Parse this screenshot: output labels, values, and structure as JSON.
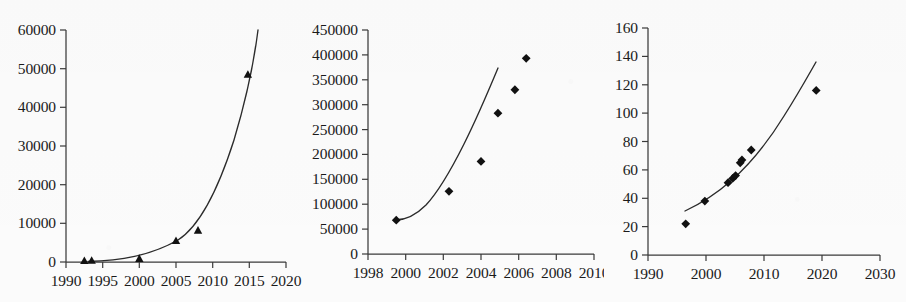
{
  "figure": {
    "panel_count": 3,
    "background_color": "#fbfbfb",
    "marker_color": "#111111",
    "curve_color": "#2b2b2b",
    "axis_color": "#3a3a3a"
  },
  "chart_data": [
    {
      "id": "panel-a",
      "type": "scatter",
      "title": "",
      "xlabel": "",
      "ylabel": "",
      "xlim": [
        1990,
        2020
      ],
      "ylim": [
        0,
        60000
      ],
      "xticks": [
        1990,
        1995,
        2000,
        2005,
        2010,
        2015,
        2020
      ],
      "xtick_labels": [
        "1990",
        "1995",
        "2000",
        "2005",
        "2010",
        "2015",
        "2020"
      ],
      "yticks": [
        0,
        10000,
        20000,
        30000,
        40000,
        50000,
        60000
      ],
      "ytick_labels": [
        "0",
        "10000",
        "20000",
        "30000",
        "40000",
        "50000",
        "60000"
      ],
      "grid": false,
      "legend": "none",
      "marker_shape": "triangle",
      "x": [
        1992.5,
        1993.5,
        2000.0,
        2005.0,
        2008.0,
        2014.8
      ],
      "y": [
        350,
        400,
        900,
        5500,
        8200,
        48500
      ],
      "fit_curve": {
        "type": "exponential",
        "x_start": 1993.0,
        "x_end": 2015.3,
        "y_start": 100,
        "y_end": 56000
      }
    },
    {
      "id": "panel-b",
      "type": "scatter",
      "title": "",
      "xlabel": "",
      "ylabel": "",
      "xlim": [
        1998,
        2010
      ],
      "ylim": [
        0,
        450000
      ],
      "xticks": [
        1998,
        2000,
        2002,
        2004,
        2006,
        2008,
        2010
      ],
      "xtick_labels": [
        "1998",
        "2000",
        "2002",
        "2004",
        "2006",
        "2008",
        "2010"
      ],
      "yticks": [
        0,
        50000,
        100000,
        150000,
        200000,
        250000,
        300000,
        350000,
        400000,
        450000
      ],
      "ytick_labels": [
        "0",
        "50000",
        "100000",
        "150000",
        "200000",
        "250000",
        "300000",
        "350000",
        "400000",
        "450000"
      ],
      "grid": false,
      "legend": "none",
      "marker_shape": "diamond",
      "x": [
        1999.5,
        2002.3,
        2004.0,
        2004.9,
        2005.8,
        2006.4
      ],
      "y": [
        68000,
        126000,
        186000,
        283000,
        330000,
        393000
      ],
      "fit_curve": {
        "type": "exponential",
        "x_start": 1999.4,
        "x_end": 2006.6,
        "y_start": 68000,
        "y_end": 405000
      }
    },
    {
      "id": "panel-c",
      "type": "scatter",
      "title": "",
      "xlabel": "",
      "ylabel": "",
      "xlim": [
        1990,
        2030
      ],
      "ylim": [
        0,
        160
      ],
      "xticks": [
        1990,
        2000,
        2010,
        2020,
        2030
      ],
      "xtick_labels": [
        "1990",
        "2000",
        "2010",
        "2020",
        "2030"
      ],
      "yticks": [
        0,
        20,
        40,
        60,
        80,
        100,
        120,
        140,
        160
      ],
      "ytick_labels": [
        "0",
        "20",
        "40",
        "60",
        "80",
        "100",
        "120",
        "140",
        "160"
      ],
      "grid": false,
      "legend": "none",
      "marker_shape": "diamond",
      "x": [
        1996.5,
        1999.8,
        2003.8,
        2004.6,
        2005.1,
        2005.9,
        2006.2,
        2007.8,
        2019.0
      ],
      "y": [
        22,
        38,
        51,
        54,
        56,
        65,
        67,
        74,
        116
      ],
      "fit_curve": {
        "type": "exponential",
        "x_start": 1996.3,
        "x_end": 2019.4,
        "y_start": 31,
        "y_end": 136
      }
    }
  ]
}
